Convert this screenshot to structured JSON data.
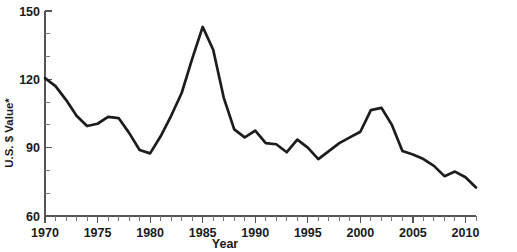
{
  "chart_data": {
    "type": "line",
    "title": "",
    "xlabel": "Year",
    "ylabel": "U.S. $ Value*",
    "xlim": [
      1970,
      2011
    ],
    "ylim": [
      60,
      150
    ],
    "grid": false,
    "legend": "none",
    "line_color": "#1c1c1c",
    "background_color": "#ffffff",
    "y_ticks_major": [
      60,
      90,
      120,
      150
    ],
    "y_tick_labels": [
      "60",
      "90",
      "120",
      "150"
    ],
    "y_ticks_minor": [
      70,
      80,
      100,
      110,
      130,
      140
    ],
    "x_ticks_major": [
      1970,
      1975,
      1980,
      1985,
      1990,
      1995,
      2000,
      2005,
      2010
    ],
    "x_tick_labels": [
      "1970",
      "1975",
      "1980",
      "1985",
      "1990",
      "1995",
      "2000",
      "2005",
      "2010"
    ],
    "x_tick_minor_step": 1,
    "x": [
      1970,
      1971,
      1972,
      1973,
      1974,
      1975,
      1976,
      1977,
      1978,
      1979,
      1980,
      1981,
      1982,
      1983,
      1984,
      1985,
      1986,
      1987,
      1988,
      1989,
      1990,
      1991,
      1992,
      1993,
      1994,
      1995,
      1996,
      1997,
      1998,
      1999,
      2000,
      2001,
      2002,
      2003,
      2004,
      2005,
      2006,
      2007,
      2008,
      2009,
      2010,
      2011
    ],
    "values": [
      120.5,
      117.0,
      111.0,
      104.0,
      99.5,
      100.5,
      103.5,
      103.0,
      96.5,
      89.0,
      87.5,
      95.0,
      104.0,
      114.0,
      129.0,
      143.0,
      133.0,
      112.0,
      98.0,
      94.5,
      97.5,
      92.0,
      91.5,
      88.0,
      93.5,
      90.0,
      85.0,
      88.5,
      92.0,
      94.5,
      97.0,
      106.5,
      107.5,
      100.0,
      88.5,
      87.0,
      85.0,
      82.0,
      77.5,
      79.5,
      77.0,
      72.5
    ],
    "series_name": "U.S. $ Value"
  },
  "axis": {
    "y_title": "U.S. $ Value*",
    "x_title": "Year"
  }
}
